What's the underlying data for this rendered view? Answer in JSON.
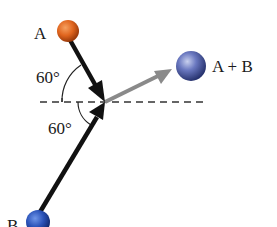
{
  "diagram": {
    "particles": [
      {
        "id": "A",
        "label": "A",
        "color": "#e0651e"
      },
      {
        "id": "B",
        "label": "B",
        "color": "#2a52b8"
      },
      {
        "id": "AB",
        "label": "A + B",
        "color": "#5566b0"
      }
    ],
    "angles": [
      {
        "id": "angle-A",
        "label": "60°"
      },
      {
        "id": "angle-B",
        "label": "60°"
      }
    ],
    "colors": {
      "incoming_arrow": "#111111",
      "outgoing_arrow": "#8a8a8a",
      "reference_line": "#333333"
    }
  }
}
